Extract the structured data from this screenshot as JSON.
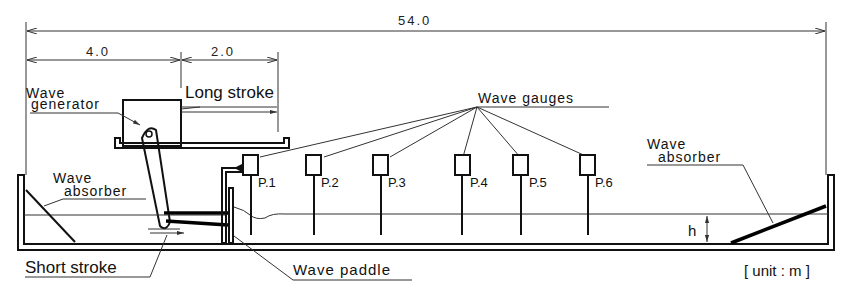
{
  "dimensions": {
    "total_length": "54.0",
    "generator_offset": "4.0",
    "long_stroke_range": "2.0"
  },
  "labels": {
    "wave_generator_line1": "Wave",
    "wave_generator_line2": "generator",
    "long_stroke": "Long stroke",
    "wave_gauges": "Wave gauges",
    "wave_absorber_left_line1": "Wave",
    "wave_absorber_left_line2": "absorber",
    "wave_absorber_right_line1": "Wave",
    "wave_absorber_right_line2": "absorber",
    "short_stroke": "Short stroke",
    "wave_paddle": "Wave paddle",
    "water_depth": "h",
    "unit": "[ unit : m ]"
  },
  "gauges": [
    {
      "label": "P.1"
    },
    {
      "label": "P.2"
    },
    {
      "label": "P.3"
    },
    {
      "label": "P.4"
    },
    {
      "label": "P.5"
    },
    {
      "label": "P.6"
    }
  ]
}
